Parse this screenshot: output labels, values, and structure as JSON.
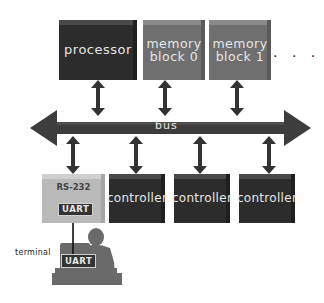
{
  "diagram": {
    "top_row": [
      {
        "id": "processor",
        "label": "processor"
      },
      {
        "id": "memory-block-0",
        "label_line1": "memory",
        "label_line2": "block 0"
      },
      {
        "id": "memory-block-1",
        "label_line1": "memory",
        "label_line2": "block 1"
      }
    ],
    "ellipsis": "· · ·",
    "bus": {
      "label": "bus"
    },
    "bottom_row": [
      {
        "id": "rs232",
        "label": "RS-232",
        "inner_label": "UART"
      },
      {
        "id": "controller-1",
        "label": "controller"
      },
      {
        "id": "controller-2",
        "label": "controller"
      },
      {
        "id": "controller-3",
        "label": "controller"
      }
    ],
    "terminal": {
      "label": "terminal",
      "uart_label": "UART"
    },
    "colors": {
      "processor": "#2c2c2c",
      "memory": "#6f6f6f",
      "controller": "#2c2c2c",
      "rs232": "#b9b9b9",
      "bus": "#3d3d3d",
      "arrows": "#333333",
      "person": "#6a6a6a"
    }
  }
}
